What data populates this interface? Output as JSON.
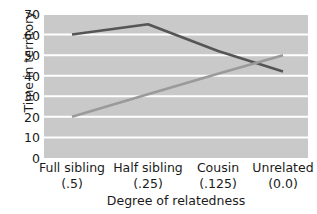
{
  "chart_data": {
    "type": "line",
    "title": "",
    "xlabel": "Degree of relatedness",
    "ylabel": "Time in territory",
    "categories": [
      "Full sibling\n(.5)",
      "Half sibling\n(.25)",
      "Cousin\n(.125)",
      "Unrelated\n(0.0)"
    ],
    "category_lines": [
      {
        "line1": "Full sibling",
        "line2": "(.5)"
      },
      {
        "line1": "Half sibling",
        "line2": "(.25)"
      },
      {
        "line1": "Cousin",
        "line2": "(.125)"
      },
      {
        "line1": "Unrelated",
        "line2": "(0.0)"
      }
    ],
    "yticks": [
      70,
      60,
      50,
      40,
      30,
      20,
      10,
      0
    ],
    "ylim": [
      0,
      70
    ],
    "grid": "horizontal-white",
    "legend": "none",
    "series": [
      {
        "name": "dark-line",
        "color": "#555555",
        "values": [
          60,
          65,
          52,
          42
        ]
      },
      {
        "name": "light-line",
        "color": "#9a9a9a",
        "values": [
          20,
          31,
          41,
          50
        ]
      }
    ],
    "plot_background": "#c9c9c9",
    "gridline_color": "#ffffff"
  }
}
